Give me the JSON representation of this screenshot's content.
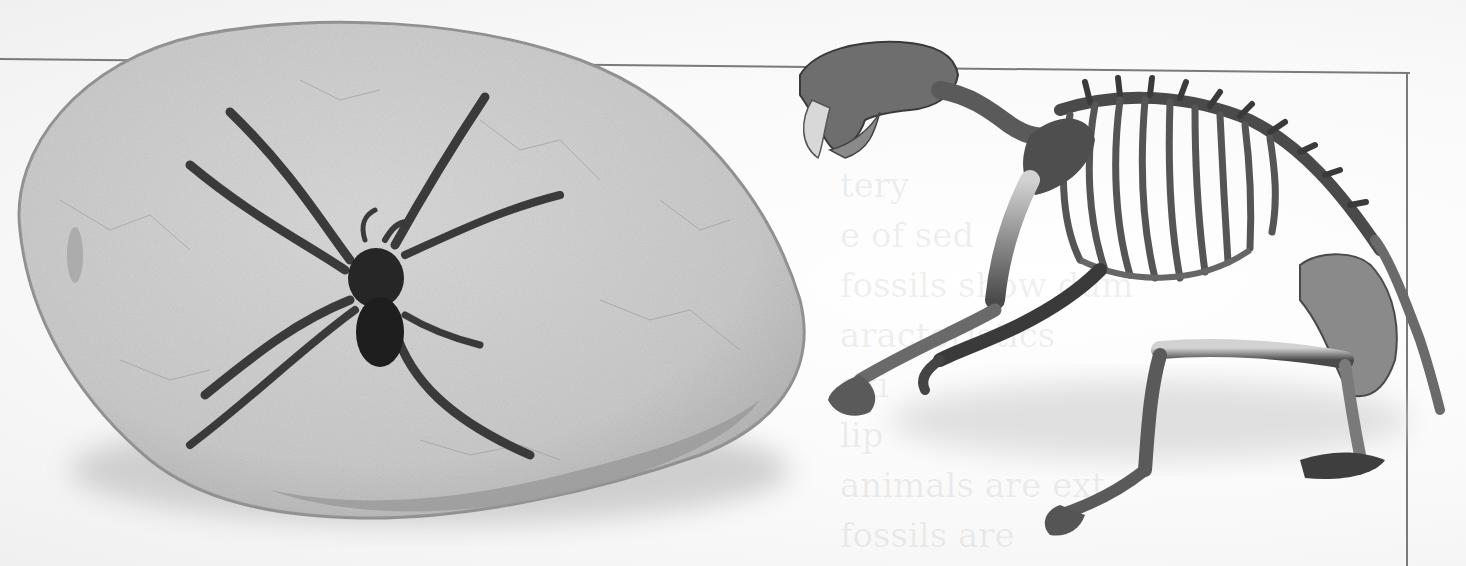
{
  "scene": {
    "description": "Scanned textbook page showing a fossilized spider in a stone slab and a saber-toothed cat skeleton",
    "colors": {
      "paper": "#f7f7f7",
      "frame": "#7a7a7a",
      "stone": "#c9c9c9",
      "stone_edge": "#8f8f8f",
      "spider": "#2a2a2a",
      "bone_light": "#bdbdbd",
      "bone_dark": "#3c3c3c"
    }
  },
  "figures": [
    {
      "id": "fossil-spider",
      "label": "Fossil spider in stone slab"
    },
    {
      "id": "sabertooth-skeleton",
      "label": "Saber-toothed cat skeleton"
    }
  ],
  "show_through_text": [
    "                tery",
    "         e of sed",
    "fossils show dum",
    "        aracteristics",
    "ski",
    "        lip",
    "  animals are ext",
    "  fossils are"
  ]
}
